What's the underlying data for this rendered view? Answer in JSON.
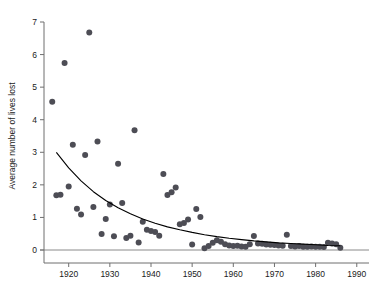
{
  "chart_data": {
    "type": "scatter",
    "title": "",
    "xlabel": "",
    "ylabel": "Average number of lives lost",
    "xlim": [
      1914,
      1992
    ],
    "ylim": [
      0,
      7.3
    ],
    "xticks": [
      1920,
      1930,
      1940,
      1950,
      1960,
      1970,
      1980,
      1990
    ],
    "xtick_labels": [
      "1920",
      "1930",
      "1940",
      "1950",
      "1960",
      "1970",
      "1980",
      "1990"
    ],
    "yticks": [
      0,
      1,
      2,
      3,
      4,
      5,
      6,
      7
    ],
    "ytick_labels": [
      "0",
      "1",
      "2",
      "3",
      "4",
      "5",
      "6",
      "7"
    ],
    "grid": false,
    "legend": false,
    "marker_color": "#4d4d55",
    "marker_size": 3.0,
    "fit_curve_color": "#000000",
    "baseline_color": "#8a8a8a",
    "series": [
      {
        "name": "Average number of lives lost",
        "x": [
          1916,
          1917,
          1918,
          1919,
          1920,
          1921,
          1922,
          1923,
          1924,
          1925,
          1926,
          1927,
          1928,
          1929,
          1930,
          1931,
          1932,
          1933,
          1934,
          1935,
          1936,
          1937,
          1938,
          1939,
          1940,
          1941,
          1942,
          1943,
          1944,
          1945,
          1946,
          1947,
          1948,
          1949,
          1950,
          1951,
          1952,
          1953,
          1954,
          1955,
          1956,
          1957,
          1958,
          1959,
          1960,
          1961,
          1962,
          1963,
          1964,
          1965,
          1966,
          1967,
          1968,
          1969,
          1970,
          1971,
          1972,
          1973,
          1974,
          1975,
          1976,
          1977,
          1978,
          1979,
          1980,
          1981,
          1982,
          1983,
          1984,
          1985,
          1986
        ],
        "y": [
          4.55,
          1.68,
          1.7,
          5.74,
          1.95,
          3.23,
          1.27,
          1.09,
          2.92,
          6.68,
          1.32,
          3.33,
          0.49,
          0.95,
          1.4,
          0.42,
          2.65,
          1.44,
          0.37,
          0.44,
          3.68,
          0.23,
          0.87,
          0.62,
          0.58,
          0.55,
          0.44,
          2.33,
          1.69,
          1.77,
          1.92,
          0.79,
          0.83,
          0.94,
          0.17,
          1.26,
          1.01,
          0.05,
          0.12,
          0.22,
          0.3,
          0.25,
          0.18,
          0.14,
          0.12,
          0.13,
          0.11,
          0.1,
          0.18,
          0.43,
          0.2,
          0.19,
          0.17,
          0.16,
          0.15,
          0.14,
          0.13,
          0.47,
          0.12,
          0.11,
          0.12,
          0.1,
          0.1,
          0.11,
          0.1,
          0.1,
          0.09,
          0.22,
          0.2,
          0.18,
          0.07
        ]
      }
    ],
    "fit_curve": {
      "name": "exponential decay fit",
      "x": [
        1917,
        1920,
        1923,
        1926,
        1929,
        1932,
        1935,
        1938,
        1941,
        1944,
        1947,
        1950,
        1953,
        1956,
        1959,
        1962,
        1965,
        1968,
        1971,
        1974,
        1977,
        1980,
        1983,
        1986
      ],
      "y": [
        3.0,
        2.52,
        2.12,
        1.79,
        1.52,
        1.3,
        1.11,
        0.95,
        0.82,
        0.71,
        0.62,
        0.54,
        0.47,
        0.41,
        0.36,
        0.32,
        0.28,
        0.25,
        0.22,
        0.2,
        0.18,
        0.16,
        0.14,
        0.13
      ]
    }
  }
}
